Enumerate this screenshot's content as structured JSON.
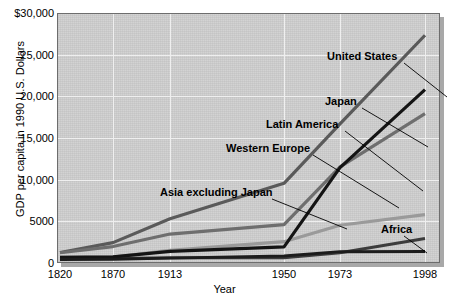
{
  "chart_data": {
    "type": "line",
    "title": "",
    "xlabel": "Year",
    "ylabel": "GDP per capita in 1990 U.S. Dollars",
    "categories": [
      "1820",
      "1870",
      "1913",
      "1950",
      "1973",
      "1998"
    ],
    "x_tick_labels": [
      "1820",
      "1870",
      "1913",
      "1950",
      "1973",
      "1998"
    ],
    "y_tick_labels": [
      "0",
      "5000",
      "10,000",
      "15,000",
      "20,000",
      "25,000",
      "$30,000"
    ],
    "y_tick_values": [
      0,
      5000,
      10000,
      15000,
      20000,
      25000,
      30000
    ],
    "ylim": [
      0,
      30000
    ],
    "grid": true,
    "legend": "inline-annotations",
    "legend_position": "inside-plot",
    "series": [
      {
        "name": "United States",
        "color": "#5a5a5a",
        "width": 3.2,
        "values": [
          1257,
          2445,
          5301,
          9561,
          16689,
          27331
        ]
      },
      {
        "name": "Japan",
        "color": "#141414",
        "width": 3.2,
        "values": [
          669,
          737,
          1387,
          1926,
          11439,
          20800
        ]
      },
      {
        "name": "Western Europe",
        "color": "#6e6e6e",
        "width": 3.2,
        "values": [
          1232,
          1974,
          3473,
          4594,
          11534,
          17921
        ]
      },
      {
        "name": "Latin America",
        "color": "#9a9a9a",
        "width": 3.2,
        "values": [
          665,
          698,
          1511,
          2554,
          4531,
          5795
        ]
      },
      {
        "name": "Asia excluding Japan",
        "color": "#3c3c3c",
        "width": 3.0,
        "values": [
          575,
          543,
          640,
          635,
          1231,
          2936
        ]
      },
      {
        "name": "Africa",
        "color": "#1c1c1c",
        "width": 3.0,
        "values": [
          418,
          444,
          585,
          852,
          1365,
          1368
        ]
      }
    ],
    "annotations": [
      {
        "label": "United States",
        "x": 327,
        "y": 50,
        "leader": [
          404,
          63,
          447,
          97
        ]
      },
      {
        "label": "Japan",
        "x": 325,
        "y": 95,
        "leader": [
          362,
          108,
          428,
          147
        ]
      },
      {
        "label": "Latin America",
        "x": 266,
        "y": 118,
        "leader": [
          345,
          131,
          423,
          191
        ]
      },
      {
        "label": "Western Europe",
        "x": 226,
        "y": 142,
        "leader": [
          313,
          155,
          399,
          208
        ]
      },
      {
        "label": "Asia excluding Japan",
        "x": 160,
        "y": 186,
        "leader": [
          272,
          199,
          347,
          229
        ]
      },
      {
        "label": "Africa",
        "x": 381,
        "y": 223,
        "leader": [
          404,
          236,
          427,
          253
        ]
      }
    ]
  }
}
